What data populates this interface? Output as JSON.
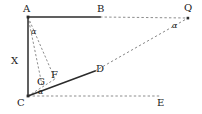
{
  "figure": {
    "type": "geometry-diagram",
    "width": 202,
    "height": 114,
    "background_color": "#ffffff",
    "stroke_color": "#2b2b2b",
    "dash_color": "#6e6e6e",
    "label_color": "#1a1a1a"
  },
  "points": {
    "A": {
      "label": "A",
      "x": 28,
      "y": 17
    },
    "B": {
      "label": "B",
      "x": 100,
      "y": 17
    },
    "Q": {
      "label": "Q",
      "x": 188,
      "y": 18
    },
    "C": {
      "label": "C",
      "x": 28,
      "y": 96
    },
    "D": {
      "label": "D",
      "x": 95,
      "y": 71
    },
    "E": {
      "label": "E",
      "x": 160,
      "y": 96
    },
    "F": {
      "label": "F",
      "x": 55,
      "y": 79
    },
    "G": {
      "label": "G",
      "x": 42,
      "y": 85
    },
    "X": {
      "label": "X",
      "x": 20,
      "y": 63
    }
  },
  "point_labels": [
    {
      "name": "label-A",
      "text": "A",
      "x": 23,
      "y": 4
    },
    {
      "name": "label-B",
      "text": "B",
      "x": 97,
      "y": 4
    },
    {
      "name": "label-Q",
      "text": "Q",
      "x": 184,
      "y": 3
    },
    {
      "name": "label-X",
      "text": "X",
      "x": 11,
      "y": 56
    },
    {
      "name": "label-F",
      "text": "F",
      "x": 51,
      "y": 70
    },
    {
      "name": "label-G",
      "text": "G",
      "x": 37,
      "y": 77
    },
    {
      "name": "label-D",
      "text": "D",
      "x": 96,
      "y": 64
    },
    {
      "name": "label-C",
      "text": "C",
      "x": 17,
      "y": 98
    },
    {
      "name": "label-E",
      "text": "E",
      "x": 157,
      "y": 98
    }
  ],
  "angle_labels": [
    {
      "name": "angle-at-A",
      "text": "α",
      "x": 31,
      "y": 28
    },
    {
      "name": "angle-at-C",
      "text": "α",
      "x": 38,
      "y": 88
    },
    {
      "name": "angle-at-Q",
      "text": "α",
      "x": 172,
      "y": 22
    }
  ],
  "solid_segments": [
    {
      "name": "segment-AB",
      "from": "A",
      "to": "B",
      "x1": 28,
      "y1": 17,
      "x2": 100,
      "y2": 17
    },
    {
      "name": "segment-AC",
      "from": "A",
      "to": "C",
      "x1": 28,
      "y1": 17,
      "x2": 28,
      "y2": 96
    },
    {
      "name": "segment-CD",
      "from": "C",
      "to": "D",
      "x1": 28,
      "y1": 96,
      "x2": 95,
      "y2": 71
    }
  ],
  "dashed_segments": [
    {
      "name": "segment-BQ",
      "from": "B",
      "to": "Q",
      "x1": 100,
      "y1": 17,
      "x2": 188,
      "y2": 18
    },
    {
      "name": "segment-DQ",
      "from": "D",
      "to": "Q",
      "x1": 95,
      "y1": 71,
      "x2": 188,
      "y2": 18
    },
    {
      "name": "segment-CE",
      "from": "C",
      "to": "E",
      "x1": 28,
      "y1": 96,
      "x2": 160,
      "y2": 96
    },
    {
      "name": "segment-AF",
      "from": "A",
      "to": "F",
      "x1": 28,
      "y1": 17,
      "x2": 55,
      "y2": 79
    },
    {
      "name": "segment-CF",
      "from": "C",
      "to": "F",
      "x1": 28,
      "y1": 96,
      "x2": 55,
      "y2": 79
    },
    {
      "name": "segment-AG",
      "from": "A",
      "to": "G",
      "x1": 28,
      "y1": 17,
      "x2": 42,
      "y2": 85
    }
  ],
  "vertex_dots": [
    {
      "name": "dot-A",
      "x": 28,
      "y": 17
    },
    {
      "name": "dot-C",
      "x": 28,
      "y": 96
    },
    {
      "name": "dot-Q",
      "x": 188,
      "y": 18
    }
  ]
}
